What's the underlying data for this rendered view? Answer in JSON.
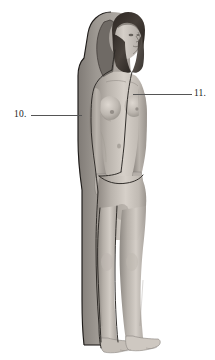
{
  "figure": {
    "orientation": "three-quarter right-facing standing pose",
    "background_color": "#ffffff",
    "skin_tone_light": "#d8d2cb",
    "skin_tone_mid": "#b2aca6",
    "skin_tone_shadow": "#8a8580",
    "silhouette_color": "#a7a29d",
    "silhouette_shadow_color": "#8e8a85",
    "hair_color": "#3a332e",
    "outline_color": "#1f1c1a",
    "contour_line_color": "#2a2724",
    "leader_line_color": "#555555",
    "label_text_color": "#1a1a1a"
  },
  "callouts": [
    {
      "id": "callout-10",
      "number": "10.",
      "side": "left",
      "label_x": 14,
      "label_y": 110,
      "leader_x": 31,
      "leader_y": 115,
      "leader_width": 51,
      "points_to": "posterior body silhouette outline at mid-back"
    },
    {
      "id": "callout-11",
      "number": "11.",
      "side": "right",
      "label_x": 194,
      "label_y": 89,
      "leader_x": 133,
      "leader_y": 94,
      "leader_width": 59,
      "points_to": "anterior midline contour line on sternum"
    }
  ],
  "parts": {
    "head": "head-with-dark-hair",
    "torso": "torso-anterior",
    "arms": "arms-at-sides",
    "legs": "legs-standing",
    "feet": "feet-bare",
    "silhouette": "posture-silhouette-behind-body",
    "midline": "anterior-midline-contour",
    "hipline": "pelvic-contour-line"
  }
}
